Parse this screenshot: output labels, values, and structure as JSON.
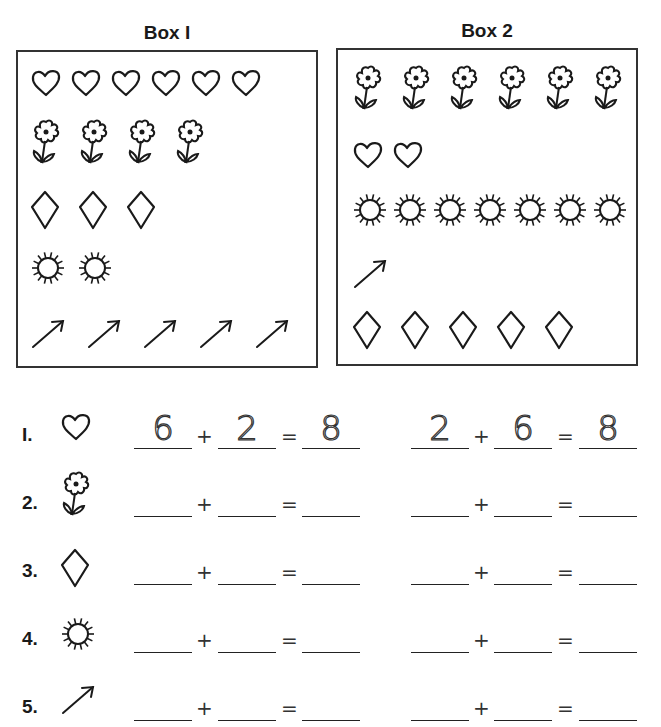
{
  "boxes": [
    {
      "title": "Box I",
      "rows": [
        {
          "shape": "heart",
          "count": 6
        },
        {
          "shape": "flower",
          "count": 4
        },
        {
          "shape": "diamond",
          "count": 3
        },
        {
          "shape": "sun",
          "count": 2
        },
        {
          "shape": "arrow",
          "count": 5
        }
      ]
    },
    {
      "title": "Box 2",
      "rows": [
        {
          "shape": "flower",
          "count": 6
        },
        {
          "shape": "heart",
          "count": 2
        },
        {
          "shape": "sun",
          "count": 7
        },
        {
          "shape": "arrow",
          "count": 1
        },
        {
          "shape": "diamond",
          "count": 5
        }
      ]
    }
  ],
  "exercises": [
    {
      "number": "I.",
      "shape": "heart",
      "eq1": {
        "a": "6",
        "b": "2",
        "sum": "8"
      },
      "eq2": {
        "a": "2",
        "b": "6",
        "sum": "8"
      }
    },
    {
      "number": "2.",
      "shape": "flower",
      "eq1": {
        "a": "",
        "b": "",
        "sum": ""
      },
      "eq2": {
        "a": "",
        "b": "",
        "sum": ""
      }
    },
    {
      "number": "3.",
      "shape": "diamond",
      "eq1": {
        "a": "",
        "b": "",
        "sum": ""
      },
      "eq2": {
        "a": "",
        "b": "",
        "sum": ""
      }
    },
    {
      "number": "4.",
      "shape": "sun",
      "eq1": {
        "a": "",
        "b": "",
        "sum": ""
      },
      "eq2": {
        "a": "",
        "b": "",
        "sum": ""
      }
    },
    {
      "number": "5.",
      "shape": "arrow",
      "eq1": {
        "a": "",
        "b": "",
        "sum": ""
      },
      "eq2": {
        "a": "",
        "b": "",
        "sum": ""
      }
    }
  ],
  "symbols": {
    "plus": "+",
    "equals": "="
  }
}
